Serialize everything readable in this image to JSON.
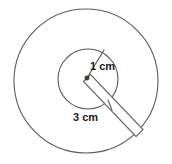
{
  "figure": {
    "background_color": "#ffffff",
    "stroke_color": "#5a5a5a",
    "arm_stroke_color": "#6b6b6b",
    "text_color": "#1b1b1b"
  },
  "shapes": {
    "outer_circle": {
      "name": "outer-circle",
      "center_x": 86,
      "center_y": 81,
      "radius": 72
    },
    "inner_circle": {
      "name": "inner-circle",
      "center_x": 88,
      "center_y": 79,
      "radius": 30
    },
    "center_dot": {
      "name": "center-point",
      "x": 87,
      "y": 78,
      "radius": 2.2
    },
    "inner_radius_line": {
      "name": "inner-radius-segment",
      "x1": 87,
      "y1": 78,
      "x2": 104,
      "y2": 50
    },
    "pointer_arm": {
      "name": "pointer-arm",
      "x1": 87,
      "y1": 78,
      "x2": 139,
      "y2": 133,
      "half_width": 4.5
    },
    "leader_tick": {
      "name": "leader-tick",
      "x1": 108,
      "y1": 100,
      "x2": 112,
      "y2": 110
    }
  },
  "labels": {
    "inner_radius": {
      "text": "1 cm",
      "x": 90,
      "y": 67
    },
    "outer_radius": {
      "text": "3 cm",
      "x": 73,
      "y": 118
    }
  }
}
